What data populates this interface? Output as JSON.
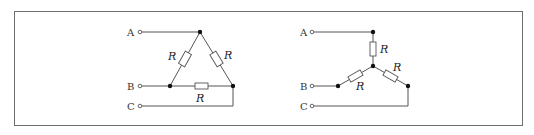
{
  "figure": {
    "delta": {
      "terminals": [
        {
          "label": "A",
          "x": 130,
          "y": 36
        },
        {
          "label": "B",
          "x": 130,
          "y": 90
        },
        {
          "label": "C",
          "x": 130,
          "y": 110
        }
      ],
      "resistor_labels": [
        {
          "text": "R",
          "x": 167,
          "y": 60
        },
        {
          "text": "R",
          "x": 222,
          "y": 59
        },
        {
          "text": "R",
          "x": 195,
          "y": 102
        }
      ]
    },
    "star": {
      "terminals": [
        {
          "label": "A",
          "x": 302,
          "y": 36
        },
        {
          "label": "B",
          "x": 302,
          "y": 90
        },
        {
          "label": "C",
          "x": 302,
          "y": 110
        }
      ],
      "resistor_labels": [
        {
          "text": "R",
          "x": 380,
          "y": 53
        },
        {
          "text": "R",
          "x": 355,
          "y": 89
        },
        {
          "text": "R",
          "x": 394,
          "y": 71
        }
      ]
    }
  }
}
